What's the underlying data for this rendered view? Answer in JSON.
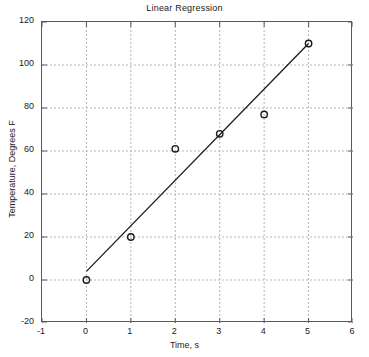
{
  "chart_data": {
    "type": "scatter",
    "title": "Linear Regression",
    "xlabel": "Time, s",
    "ylabel": "Temperature, Degrees F",
    "xlim": [
      -1,
      6
    ],
    "ylim": [
      -20,
      120
    ],
    "xticks": [
      -1,
      0,
      1,
      2,
      3,
      4,
      5,
      6
    ],
    "yticks": [
      -20,
      0,
      20,
      40,
      60,
      80,
      100,
      120
    ],
    "xtick_labels": [
      "-1",
      "0",
      "1",
      "2",
      "3",
      "4",
      "5",
      "6"
    ],
    "ytick_labels": [
      "-20",
      "0",
      "20",
      "40",
      "60",
      "80",
      "100",
      "120"
    ],
    "grid": true,
    "grid_style": "dashed",
    "grid_color": "#b4b4b4",
    "axis_color": "#5a5a5a",
    "series": [
      {
        "name": "Measured data",
        "type": "scatter",
        "marker": "circle-open",
        "marker_color": "#1a1a1a",
        "x": [
          0,
          1,
          2,
          3,
          4,
          5
        ],
        "y": [
          0,
          20,
          61,
          68,
          77,
          110
        ]
      },
      {
        "name": "Least-squares fit",
        "type": "line",
        "line_color": "#1a1a1a",
        "x": [
          0,
          5
        ],
        "y": [
          4,
          110
        ]
      }
    ]
  }
}
